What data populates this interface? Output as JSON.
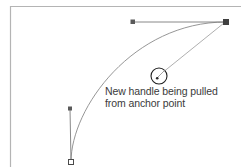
{
  "figure": {
    "kind": "bezier-pen-tool-illustration",
    "background_color": "#ffffff",
    "stroke_color": "#6e6e6e",
    "frame_color": "#b4b4b4",
    "text_color": "#3a3a3a"
  },
  "annotation": {
    "line1": "New handle being pulled",
    "line2": "from anchor point"
  },
  "frame": {
    "label": "artboard-frame",
    "left_x": 10,
    "top_y": 6,
    "right_x": 241,
    "bottom_y": 167
  },
  "curve": {
    "label": "bezier-curve",
    "start_point": [
      71,
      162
    ],
    "end_point": [
      226,
      22
    ],
    "control_point_1": [
      71,
      108
    ],
    "control_point_2": [
      133,
      22
    ]
  },
  "anchors": [
    {
      "name": "start-anchor-point",
      "x": 71,
      "y": 162,
      "filled": false,
      "description": "hollow square anchor at curve start"
    },
    {
      "name": "end-anchor-point",
      "x": 226,
      "y": 22,
      "filled": true,
      "description": "filled square anchor at curve end"
    }
  ],
  "handles": [
    {
      "name": "start-handle",
      "anchor": [
        71,
        162
      ],
      "handle_end": [
        70,
        108
      ],
      "endpoint_filled": true,
      "orientation": "vertical"
    },
    {
      "name": "end-handle",
      "anchor": [
        226,
        22
      ],
      "handle_end": [
        133,
        22
      ],
      "endpoint_filled": true,
      "orientation": "horizontal"
    }
  ],
  "cursor": {
    "name": "pen-cursor-circle",
    "center_x": 159,
    "center_y": 76,
    "radius": 8,
    "dot_radius": 1.2,
    "leader_line_to": [
      226,
      22
    ]
  }
}
